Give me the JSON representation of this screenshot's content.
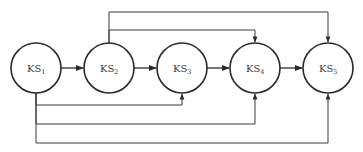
{
  "diagram": {
    "type": "directed-graph",
    "nodes": [
      {
        "id": "KS1",
        "base": "KS",
        "sub": "1",
        "cx": 36,
        "cy": 68,
        "r": 25
      },
      {
        "id": "KS2",
        "base": "KS",
        "sub": "2",
        "cx": 109,
        "cy": 68,
        "r": 25
      },
      {
        "id": "KS3",
        "base": "KS",
        "sub": "3",
        "cx": 182,
        "cy": 68,
        "r": 25
      },
      {
        "id": "KS4",
        "base": "KS",
        "sub": "4",
        "cx": 255,
        "cy": 68,
        "r": 25
      },
      {
        "id": "KS5",
        "base": "KS",
        "sub": "5",
        "cx": 328,
        "cy": 68,
        "r": 25
      }
    ],
    "edges": [
      {
        "from": "KS1",
        "to": "KS2",
        "route": "direct"
      },
      {
        "from": "KS2",
        "to": "KS3",
        "route": "direct"
      },
      {
        "from": "KS3",
        "to": "KS4",
        "route": "direct"
      },
      {
        "from": "KS4",
        "to": "KS5",
        "route": "direct"
      },
      {
        "from": "KS2",
        "to": "KS4",
        "route": "above",
        "y": 30
      },
      {
        "from": "KS2",
        "to": "KS5",
        "route": "above",
        "y": 12
      },
      {
        "from": "KS1",
        "to": "KS3",
        "route": "below",
        "y": 105
      },
      {
        "from": "KS1",
        "to": "KS4",
        "route": "below",
        "y": 124
      },
      {
        "from": "KS1",
        "to": "KS5",
        "route": "below",
        "y": 143
      }
    ]
  },
  "colors": {
    "line": "#2a2a2a",
    "text": "#3a3a3a",
    "background": "#ffffff"
  }
}
